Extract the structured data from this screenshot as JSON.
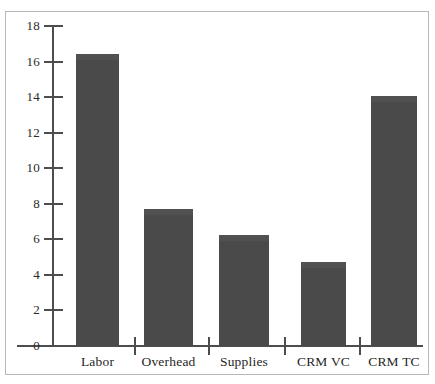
{
  "chart_data": {
    "type": "bar",
    "title": "",
    "subtitle": "",
    "xlabel": "",
    "ylabel": "",
    "categories": [
      "Labor",
      "Overhead",
      "Supplies",
      "CRM VC",
      "CRM TC"
    ],
    "values": [
      16.4,
      7.7,
      6.25,
      4.75,
      14.05
    ],
    "series": [
      {
        "name": "Cost",
        "values": [
          16.4,
          7.7,
          6.25,
          4.75,
          14.05
        ]
      }
    ],
    "ylim": [
      0,
      18
    ],
    "ytick_values": [
      0,
      2,
      4,
      6,
      8,
      10,
      12,
      14,
      16,
      18
    ],
    "ytick_labels": [
      "0",
      "2",
      "4",
      "6",
      "8",
      "10",
      "12",
      "14",
      "16",
      "18"
    ],
    "grid": false,
    "legend": null,
    "legend_position": "none",
    "annotations": [],
    "bar_color": "#4a4a4a",
    "axis_color": "#4d4d4d",
    "frame_color": "#b8b8b8",
    "background_color": "#ffffff",
    "text_color": "#1f1f1f"
  },
  "figure": {
    "frame_label": "chart-frame",
    "plot_area_label": "plot-area"
  }
}
